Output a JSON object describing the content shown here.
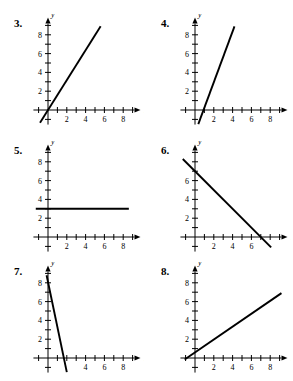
{
  "page": {
    "background_color": "#ffffff",
    "ink_color": "#000000",
    "axis_x_label": "x",
    "axis_y_label": "y",
    "x_tick_labels": [
      "2",
      "4",
      "6",
      "8"
    ],
    "y_tick_labels": [
      "2",
      "4",
      "6",
      "8"
    ]
  },
  "problems": [
    {
      "number": "3.",
      "chart_data": {
        "type": "line",
        "title": "3.",
        "xlabel": "x",
        "ylabel": "y",
        "xlim": [
          -1.6,
          9.6
        ],
        "ylim": [
          -1.6,
          9.6
        ],
        "x_ticks": [
          1,
          2,
          3,
          4,
          5,
          6,
          7,
          8,
          9
        ],
        "x_tick_labels": [
          "2",
          "4",
          "6",
          "8"
        ],
        "labeled_x_ticks": [
          2,
          4,
          6,
          8
        ],
        "y_ticks": [
          1,
          2,
          3,
          4,
          5,
          6,
          7,
          8,
          9
        ],
        "y_tick_labels": [
          "2",
          "4",
          "6",
          "8"
        ],
        "labeled_y_ticks": [
          2,
          4,
          6,
          8
        ],
        "grid": false,
        "legend": "none",
        "series": [
          {
            "name": "line-3",
            "x": [
              -0.85,
              5.6
            ],
            "y": [
              -1.35,
              8.9
            ],
            "slope": 1.6,
            "y_intercept": 0
          }
        ]
      }
    },
    {
      "number": "4.",
      "chart_data": {
        "type": "line",
        "title": "4.",
        "xlabel": "x",
        "ylabel": "y",
        "xlim": [
          -1.6,
          9.6
        ],
        "ylim": [
          -1.6,
          9.6
        ],
        "x_ticks": [
          1,
          2,
          3,
          4,
          5,
          6,
          7,
          8,
          9
        ],
        "x_tick_labels": [
          "2",
          "4",
          "6",
          "8"
        ],
        "labeled_x_ticks": [
          2,
          4,
          6,
          8
        ],
        "y_ticks": [
          1,
          2,
          3,
          4,
          5,
          6,
          7,
          8,
          9
        ],
        "y_tick_labels": [
          "2",
          "4",
          "6",
          "8"
        ],
        "labeled_y_ticks": [
          2,
          4,
          6,
          8
        ],
        "grid": false,
        "legend": "none",
        "series": [
          {
            "name": "line-4",
            "x": [
              0.35,
              4.2
            ],
            "y": [
              -1.5,
              8.9
            ],
            "slope": 2.7,
            "y_intercept": -2.45
          }
        ]
      }
    },
    {
      "number": "5.",
      "chart_data": {
        "type": "line",
        "title": "5.",
        "xlabel": "x",
        "ylabel": "y",
        "xlim": [
          -1.6,
          9.6
        ],
        "ylim": [
          -1.6,
          9.6
        ],
        "x_ticks": [
          1,
          2,
          3,
          4,
          5,
          6,
          7,
          8,
          9
        ],
        "x_tick_labels": [
          "2",
          "4",
          "6",
          "8"
        ],
        "labeled_x_ticks": [
          2,
          4,
          6,
          8
        ],
        "y_ticks": [
          1,
          2,
          3,
          4,
          5,
          6,
          7,
          8,
          9
        ],
        "y_tick_labels": [
          "2",
          "4",
          "6",
          "8"
        ],
        "labeled_y_ticks": [
          2,
          4,
          6,
          8
        ],
        "grid": false,
        "legend": "none",
        "series": [
          {
            "name": "line-5",
            "x": [
              -1.3,
              8.6
            ],
            "y": [
              3,
              3
            ],
            "slope": 0,
            "y_intercept": 3
          }
        ]
      }
    },
    {
      "number": "6.",
      "chart_data": {
        "type": "line",
        "title": "6.",
        "xlabel": "x",
        "ylabel": "y",
        "xlim": [
          -1.6,
          9.6
        ],
        "ylim": [
          -1.6,
          9.6
        ],
        "x_ticks": [
          1,
          2,
          3,
          4,
          5,
          6,
          7,
          8,
          9
        ],
        "x_tick_labels": [
          "2",
          "4",
          "6",
          "8"
        ],
        "labeled_x_ticks": [
          2,
          4,
          6
        ],
        "y_ticks": [
          1,
          2,
          3,
          4,
          5,
          6,
          7,
          8,
          9
        ],
        "y_tick_labels": [
          "2",
          "4",
          "6"
        ],
        "labeled_y_ticks": [
          2,
          4,
          6
        ],
        "grid": false,
        "legend": "none",
        "series": [
          {
            "name": "line-6",
            "x": [
              -1.3,
              8.1
            ],
            "y": [
              8.3,
              -1.1
            ],
            "slope": -1,
            "y_intercept": 7
          }
        ]
      }
    },
    {
      "number": "7.",
      "chart_data": {
        "type": "line",
        "title": "7.",
        "xlabel": "x",
        "ylabel": "y",
        "xlim": [
          -1.6,
          9.6
        ],
        "ylim": [
          -1.6,
          9.6
        ],
        "x_ticks": [
          1,
          2,
          3,
          4,
          5,
          6,
          7,
          8,
          9
        ],
        "x_tick_labels": [
          "4",
          "6",
          "8"
        ],
        "labeled_x_ticks": [
          4,
          6,
          8
        ],
        "y_ticks": [
          1,
          2,
          3,
          4,
          5,
          6,
          7,
          8,
          9
        ],
        "y_tick_labels": [
          "2",
          "4",
          "6",
          "8"
        ],
        "labeled_y_ticks": [
          2,
          4,
          6,
          8
        ],
        "grid": false,
        "legend": "none",
        "series": [
          {
            "name": "line-7",
            "x": [
              -0.15,
              2.0
            ],
            "y": [
              8.8,
              -1.5
            ],
            "slope": -4.8,
            "y_intercept": 8.1
          }
        ]
      }
    },
    {
      "number": "8.",
      "chart_data": {
        "type": "line",
        "title": "8.",
        "xlabel": "x",
        "ylabel": "y",
        "xlim": [
          -1.6,
          9.6
        ],
        "ylim": [
          -1.6,
          9.6
        ],
        "x_ticks": [
          1,
          2,
          3,
          4,
          5,
          6,
          7,
          8,
          9
        ],
        "x_tick_labels": [
          "2",
          "4",
          "6",
          "8"
        ],
        "labeled_x_ticks": [
          2,
          4,
          6,
          8
        ],
        "y_ticks": [
          1,
          2,
          3,
          4,
          5,
          6,
          7,
          8,
          9
        ],
        "y_tick_labels": [
          "2",
          "4",
          "6",
          "8"
        ],
        "labeled_y_ticks": [
          2,
          4,
          6,
          8
        ],
        "grid": false,
        "legend": "none",
        "series": [
          {
            "name": "line-8",
            "x": [
              -1.1,
              9.2
            ],
            "y": [
              -0.15,
              6.9
            ],
            "slope": 0.69,
            "y_intercept": 0.6
          }
        ]
      }
    }
  ]
}
